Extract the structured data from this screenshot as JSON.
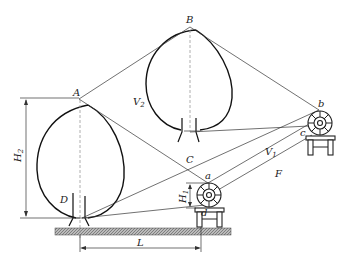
{
  "diagram": {
    "type": "orchard-sprayer-geometry",
    "points": {
      "A": "A",
      "B": "B",
      "C": "C",
      "D": "D",
      "a": "a",
      "b": "b",
      "c": "c",
      "d": "d"
    },
    "volumes": {
      "V1": {
        "base": "V",
        "sub": "1"
      },
      "V2": {
        "base": "V",
        "sub": "2"
      }
    },
    "region_label": "F",
    "dimensions": {
      "H1": {
        "base": "H",
        "sub": "1"
      },
      "H2": {
        "base": "H",
        "sub": "2"
      },
      "L": "L"
    },
    "components": [
      "left-tree-crown",
      "right-tree-crown",
      "sprayer-position-a",
      "sprayer-position-b",
      "ground"
    ]
  }
}
